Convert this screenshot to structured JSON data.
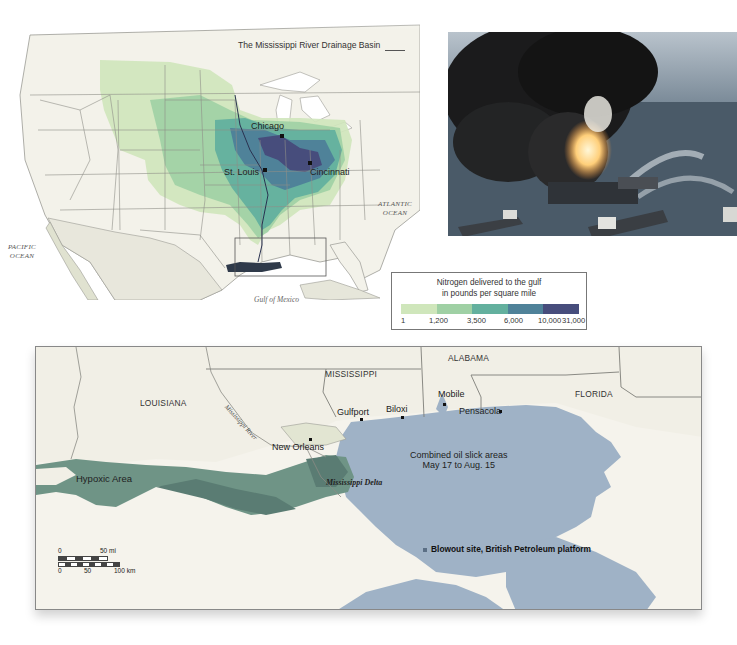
{
  "us_map": {
    "title": "The Mississippi River Drainage Basin",
    "cities": [
      {
        "name": "Chicago"
      },
      {
        "name": "St. Louis"
      },
      {
        "name": "Cincinnati"
      }
    ],
    "oceans": {
      "atlantic_line1": "ATLANTIC",
      "atlantic_line2": "OCEAN",
      "pacific_line1": "PACIFIC",
      "pacific_line2": "OCEAN",
      "gulf": "Gulf of Mexico"
    }
  },
  "photo": {
    "subject": "oil-platform-fire-photo"
  },
  "legend": {
    "title_line1": "Nitrogen delivered to the gulf",
    "title_line2": "in pounds per square mile",
    "ticks": [
      "1",
      "1,200",
      "3,500",
      "6,000",
      "10,000",
      "31,000"
    ],
    "colors": [
      "#cfe6bb",
      "#9fd0a4",
      "#63b09e",
      "#4f8299",
      "#474d7c"
    ]
  },
  "gulf_map": {
    "states": {
      "louisiana": "LOUISIANA",
      "mississippi": "MISSISSIPPI",
      "alabama": "ALABAMA",
      "florida": "FLORIDA"
    },
    "cities": {
      "mobile": "Mobile",
      "gulfport": "Gulfport",
      "biloxi": "Biloxi",
      "pensacola": "Pensacola",
      "new_orleans": "New Orleans"
    },
    "river_label": "Mississippi River",
    "delta_label": "Mississippi Delta",
    "hypoxic_label": "Hypoxic Area",
    "oil_slick_line1": "Combined oil slick areas",
    "oil_slick_line2": "May 17 to Aug. 15",
    "blowout_label": "Blowout site, British Petroleum platform",
    "scale": {
      "mi_zero": "0",
      "mi_label": "50 mi",
      "km_zero": "0",
      "km_mid": "50",
      "km_label": "100 km"
    },
    "colors": {
      "land": "#f1efe6",
      "oil_slick": "#9fb2c6",
      "hypoxic": "#6f9486",
      "hypoxic_dark": "#5a7c73"
    }
  }
}
